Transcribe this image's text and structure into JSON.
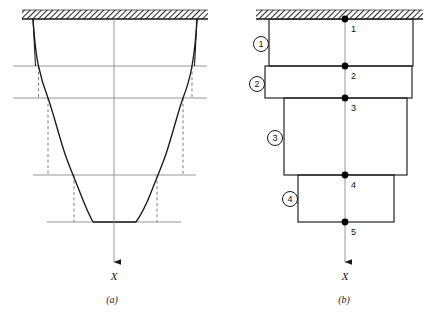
{
  "figure": {
    "title_a": "(a)",
    "title_b": "(b)",
    "axis_label_a": "X",
    "axis_label_b": "X",
    "support_name": "fixed-support-hatched-band",
    "colors": {
      "ink": "#1a1a1a",
      "gridline": "#8c8c8c",
      "dashed": "#6e6e6e",
      "node": "#000000",
      "hatch": "#2b2b2b",
      "background": "#ffffff"
    }
  },
  "panel_a": {
    "name": "tapered-bar-continuous",
    "description": "Continuous tapered bar fixed at top with stepped approximation overlay",
    "support": {
      "x": 22,
      "y": 10,
      "width": 186,
      "height": 9
    },
    "axis": {
      "x": 114,
      "y_top": 19,
      "y_bottom": 277,
      "arrow_y": 262,
      "label": "X",
      "label_x": 114,
      "label_y": 277
    },
    "profile_left": [
      [
        33,
        19
      ],
      [
        35.5,
        45
      ],
      [
        38.5,
        66
      ],
      [
        43,
        85
      ],
      [
        48,
        98
      ],
      [
        56,
        126
      ],
      [
        63,
        150
      ],
      [
        69,
        165
      ],
      [
        74,
        175
      ],
      [
        82,
        200
      ],
      [
        88,
        215
      ],
      [
        93,
        222
      ]
    ],
    "profile_right": [
      [
        197,
        19
      ],
      [
        195,
        45
      ],
      [
        192,
        66
      ],
      [
        188,
        85
      ],
      [
        183,
        98
      ],
      [
        175,
        126
      ],
      [
        168,
        150
      ],
      [
        162,
        165
      ],
      [
        157,
        175
      ],
      [
        148,
        200
      ],
      [
        141,
        215
      ],
      [
        136,
        222
      ]
    ],
    "bottom_y": 222,
    "gridlines_y": [
      66,
      98,
      175,
      222
    ],
    "gridline_x_start": 13,
    "gridline_x_end": 207,
    "step_segments": [
      {
        "left": 33,
        "right": 197,
        "top": 19,
        "bottom": 66
      },
      {
        "left": 38.5,
        "right": 192,
        "top": 66,
        "bottom": 98
      },
      {
        "left": 48,
        "right": 183,
        "top": 98,
        "bottom": 175
      },
      {
        "left": 74,
        "right": 157,
        "top": 175,
        "bottom": 222
      }
    ],
    "caption": "(a)",
    "caption_x": 112,
    "caption_y": 302
  },
  "panel_b": {
    "name": "stepped-bar-discretized",
    "description": "Four-element stepped finite element model with five nodes",
    "support": {
      "x": 256,
      "y": 10,
      "width": 167,
      "height": 9
    },
    "axis": {
      "x": 345,
      "y_top": 19,
      "y_bottom": 277,
      "arrow_y": 262,
      "label": "X",
      "label_x": 345,
      "label_y": 277
    },
    "steps": [
      {
        "id": 1,
        "left": 269,
        "right": 413,
        "top": 19,
        "bottom": 66
      },
      {
        "id": 2,
        "left": 265,
        "right": 412,
        "top": 66,
        "bottom": 98
      },
      {
        "id": 3,
        "left": 284,
        "right": 407,
        "top": 98,
        "bottom": 175
      },
      {
        "id": 4,
        "left": 298,
        "right": 394,
        "top": 175,
        "bottom": 222
      }
    ],
    "elements": [
      {
        "label": "1",
        "cx": 261,
        "cy": 44
      },
      {
        "label": "2",
        "cx": 257,
        "cy": 84
      },
      {
        "label": "3",
        "cx": 275,
        "cy": 138
      },
      {
        "label": "4",
        "cx": 290,
        "cy": 199
      }
    ],
    "element_circle_radius": 7.5,
    "nodes": [
      {
        "label": "1",
        "x": 345,
        "y": 19,
        "lx": 351,
        "ly": 31
      },
      {
        "label": "2",
        "x": 345,
        "y": 66,
        "lx": 351,
        "ly": 78
      },
      {
        "label": "3",
        "x": 345,
        "y": 98,
        "lx": 351,
        "ly": 110
      },
      {
        "label": "4",
        "x": 345,
        "y": 175,
        "lx": 351,
        "ly": 187
      },
      {
        "label": "5",
        "x": 345,
        "y": 222,
        "lx": 351,
        "ly": 234
      }
    ],
    "node_radius": 3.4,
    "caption": "(b)",
    "caption_x": 344,
    "caption_y": 302
  }
}
